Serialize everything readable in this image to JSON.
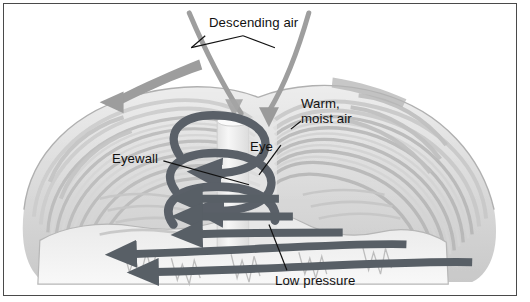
{
  "figure": {
    "width": 530,
    "height": 302,
    "background": "#ffffff",
    "frame_color": "#4a4a4a"
  },
  "palette": {
    "cloud_light": "#efefef",
    "cloud_mid": "#d8d8d8",
    "cloud_dark": "#bdbdbd",
    "cloud_outline": "#a8a8a8",
    "eye_fill": "#f4f4f4",
    "spiral_arrow": "#5a6068",
    "inflow_arrow": "#585f66",
    "outflow_arrow": "#9a9a9a",
    "descending_line": "#9e9e9e",
    "leader_line": "#111111",
    "text": "#111111"
  },
  "labels": [
    {
      "id": "descending-air",
      "text": "Descending air",
      "x": 208,
      "y": 14
    },
    {
      "id": "warm-moist-air",
      "text": "Warm,\nmoist air",
      "x": 300,
      "y": 95
    },
    {
      "id": "eye",
      "text": "Eye",
      "x": 249,
      "y": 138
    },
    {
      "id": "eyewall",
      "text": "Eyewall",
      "x": 111,
      "y": 150
    },
    {
      "id": "low-pressure",
      "text": "Low pressure",
      "x": 274,
      "y": 272
    }
  ],
  "features": {
    "eye": {
      "name": "eye",
      "description": "Calm clear cylindrical column at the storm centre"
    },
    "eyewall": {
      "name": "eyewall",
      "description": "Ring of towering convective cloud surrounding the eye"
    },
    "spiral_updraft": {
      "name": "spiral-updraft",
      "description": "Dark helical arrows showing air spiralling upward around the eyewall",
      "turns": 3
    },
    "outflow": {
      "name": "upper-level-outflow",
      "description": "Gray tapered arrow showing air flowing outward at the cloud top",
      "direction": "left"
    },
    "descending_air": {
      "name": "descending-air-flow",
      "description": "Two curved gray lines converging to a downward arrow inside the eye",
      "direction": "down"
    },
    "inflow": {
      "name": "low-level-inflow",
      "description": "Dark horizontal arrows showing surface air drawn in toward the low pressure centre",
      "count": 5,
      "direction": "left"
    }
  }
}
